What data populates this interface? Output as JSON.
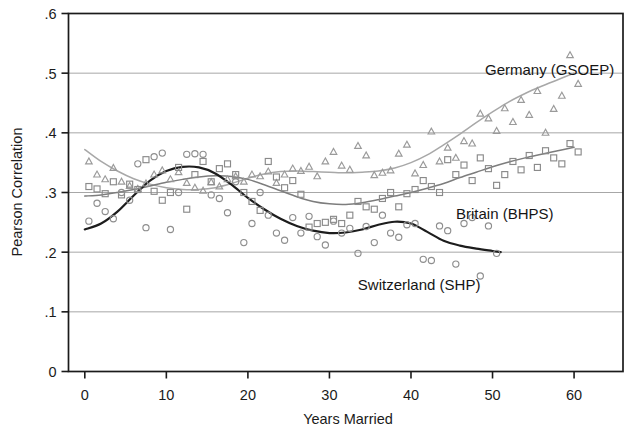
{
  "chart_data": {
    "type": "scatter",
    "title": "",
    "xlabel": "Years Married",
    "ylabel": "Pearson Correlation",
    "xlim": [
      -2,
      66
    ],
    "ylim": [
      0,
      0.6
    ],
    "xticks": [
      0,
      10,
      20,
      30,
      40,
      50,
      60
    ],
    "xticklabels": [
      "0",
      "10",
      "20",
      "30",
      "40",
      "50",
      "60"
    ],
    "yticks": [
      0,
      0.1,
      0.2,
      0.3,
      0.4,
      0.5,
      0.6
    ],
    "yticklabels": [
      "0",
      ".1",
      ".2",
      ".3",
      ".4",
      ".5",
      ".6"
    ],
    "grid": "horizontal",
    "legend_position": "inline-annotations",
    "series": [
      {
        "name": "Germany (GSOEP)",
        "marker": "triangle",
        "color": "#9a9a9a",
        "line_color": "#a8a8a8",
        "label_x": 57,
        "label_y": 0.497,
        "points": [
          {
            "x": 0.5,
            "y": 0.352
          },
          {
            "x": 1.5,
            "y": 0.33
          },
          {
            "x": 2.5,
            "y": 0.322
          },
          {
            "x": 3.5,
            "y": 0.341
          },
          {
            "x": 4.5,
            "y": 0.318
          },
          {
            "x": 5.5,
            "y": 0.311
          },
          {
            "x": 6.5,
            "y": 0.306
          },
          {
            "x": 7.5,
            "y": 0.315
          },
          {
            "x": 8.5,
            "y": 0.33
          },
          {
            "x": 9.5,
            "y": 0.337
          },
          {
            "x": 10.5,
            "y": 0.322
          },
          {
            "x": 11.5,
            "y": 0.334
          },
          {
            "x": 12.5,
            "y": 0.316
          },
          {
            "x": 13.5,
            "y": 0.308
          },
          {
            "x": 14.5,
            "y": 0.303
          },
          {
            "x": 15.5,
            "y": 0.317
          },
          {
            "x": 16.5,
            "y": 0.31
          },
          {
            "x": 17.5,
            "y": 0.322
          },
          {
            "x": 18.5,
            "y": 0.327
          },
          {
            "x": 19.5,
            "y": 0.318
          },
          {
            "x": 20.5,
            "y": 0.33
          },
          {
            "x": 21.5,
            "y": 0.327
          },
          {
            "x": 22.5,
            "y": 0.335
          },
          {
            "x": 23.5,
            "y": 0.316
          },
          {
            "x": 24.5,
            "y": 0.33
          },
          {
            "x": 25.5,
            "y": 0.34
          },
          {
            "x": 26.5,
            "y": 0.336
          },
          {
            "x": 27.5,
            "y": 0.343
          },
          {
            "x": 28.5,
            "y": 0.327
          },
          {
            "x": 29.5,
            "y": 0.352
          },
          {
            "x": 30.5,
            "y": 0.368
          },
          {
            "x": 31.5,
            "y": 0.345
          },
          {
            "x": 32.5,
            "y": 0.338
          },
          {
            "x": 33.5,
            "y": 0.378
          },
          {
            "x": 34.5,
            "y": 0.362
          },
          {
            "x": 35.5,
            "y": 0.329
          },
          {
            "x": 36.5,
            "y": 0.333
          },
          {
            "x": 37.5,
            "y": 0.337
          },
          {
            "x": 38.5,
            "y": 0.365
          },
          {
            "x": 39.5,
            "y": 0.38
          },
          {
            "x": 40.5,
            "y": 0.332
          },
          {
            "x": 41.5,
            "y": 0.346
          },
          {
            "x": 42.5,
            "y": 0.402
          },
          {
            "x": 43.5,
            "y": 0.352
          },
          {
            "x": 44.5,
            "y": 0.375
          },
          {
            "x": 45.5,
            "y": 0.358
          },
          {
            "x": 46.5,
            "y": 0.386
          },
          {
            "x": 47.5,
            "y": 0.382
          },
          {
            "x": 48.5,
            "y": 0.432
          },
          {
            "x": 49.5,
            "y": 0.424
          },
          {
            "x": 50.5,
            "y": 0.403
          },
          {
            "x": 51.5,
            "y": 0.441
          },
          {
            "x": 52.5,
            "y": 0.418
          },
          {
            "x": 53.5,
            "y": 0.455
          },
          {
            "x": 54.5,
            "y": 0.43
          },
          {
            "x": 55.5,
            "y": 0.47
          },
          {
            "x": 56.5,
            "y": 0.4
          },
          {
            "x": 57.5,
            "y": 0.44
          },
          {
            "x": 58.5,
            "y": 0.462
          },
          {
            "x": 59.5,
            "y": 0.53
          },
          {
            "x": 60.5,
            "y": 0.482
          }
        ],
        "fit": [
          {
            "x": 0,
            "y": 0.372
          },
          {
            "x": 2,
            "y": 0.352
          },
          {
            "x": 4,
            "y": 0.336
          },
          {
            "x": 6,
            "y": 0.323
          },
          {
            "x": 8,
            "y": 0.314
          },
          {
            "x": 10,
            "y": 0.308
          },
          {
            "x": 12,
            "y": 0.305
          },
          {
            "x": 14,
            "y": 0.305
          },
          {
            "x": 16,
            "y": 0.308
          },
          {
            "x": 18,
            "y": 0.315
          },
          {
            "x": 20,
            "y": 0.324
          },
          {
            "x": 22,
            "y": 0.331
          },
          {
            "x": 24,
            "y": 0.335
          },
          {
            "x": 26,
            "y": 0.336
          },
          {
            "x": 28,
            "y": 0.335
          },
          {
            "x": 30,
            "y": 0.334
          },
          {
            "x": 32,
            "y": 0.333
          },
          {
            "x": 34,
            "y": 0.334
          },
          {
            "x": 36,
            "y": 0.336
          },
          {
            "x": 38,
            "y": 0.341
          },
          {
            "x": 40,
            "y": 0.35
          },
          {
            "x": 42,
            "y": 0.363
          },
          {
            "x": 44,
            "y": 0.38
          },
          {
            "x": 46,
            "y": 0.398
          },
          {
            "x": 48,
            "y": 0.417
          },
          {
            "x": 50,
            "y": 0.435
          },
          {
            "x": 52,
            "y": 0.452
          },
          {
            "x": 54,
            "y": 0.466
          },
          {
            "x": 56,
            "y": 0.478
          },
          {
            "x": 58,
            "y": 0.489
          },
          {
            "x": 60,
            "y": 0.5
          }
        ]
      },
      {
        "name": "Britain (BHPS)",
        "marker": "square",
        "color": "#8a8a8a",
        "line_color": "#7d7d7d",
        "label_x": 51.5,
        "label_y": 0.256,
        "points": [
          {
            "x": 0.5,
            "y": 0.31
          },
          {
            "x": 1.5,
            "y": 0.306
          },
          {
            "x": 2.5,
            "y": 0.298
          },
          {
            "x": 3.5,
            "y": 0.318
          },
          {
            "x": 4.5,
            "y": 0.296
          },
          {
            "x": 5.5,
            "y": 0.314
          },
          {
            "x": 6.5,
            "y": 0.305
          },
          {
            "x": 7.5,
            "y": 0.355
          },
          {
            "x": 8.5,
            "y": 0.302
          },
          {
            "x": 9.5,
            "y": 0.287
          },
          {
            "x": 10.5,
            "y": 0.3
          },
          {
            "x": 11.5,
            "y": 0.342
          },
          {
            "x": 12.5,
            "y": 0.272
          },
          {
            "x": 13.5,
            "y": 0.33
          },
          {
            "x": 14.5,
            "y": 0.352
          },
          {
            "x": 15.5,
            "y": 0.318
          },
          {
            "x": 16.5,
            "y": 0.34
          },
          {
            "x": 17.5,
            "y": 0.348
          },
          {
            "x": 18.5,
            "y": 0.33
          },
          {
            "x": 19.5,
            "y": 0.3
          },
          {
            "x": 20.5,
            "y": 0.285
          },
          {
            "x": 21.5,
            "y": 0.27
          },
          {
            "x": 22.5,
            "y": 0.352
          },
          {
            "x": 23.5,
            "y": 0.326
          },
          {
            "x": 24.5,
            "y": 0.308
          },
          {
            "x": 25.5,
            "y": 0.32
          },
          {
            "x": 26.5,
            "y": 0.297
          },
          {
            "x": 27.5,
            "y": 0.242
          },
          {
            "x": 28.5,
            "y": 0.248
          },
          {
            "x": 29.5,
            "y": 0.25
          },
          {
            "x": 30.5,
            "y": 0.255
          },
          {
            "x": 31.5,
            "y": 0.248
          },
          {
            "x": 32.5,
            "y": 0.262
          },
          {
            "x": 33.5,
            "y": 0.285
          },
          {
            "x": 34.5,
            "y": 0.276
          },
          {
            "x": 35.5,
            "y": 0.272
          },
          {
            "x": 36.5,
            "y": 0.29
          },
          {
            "x": 37.5,
            "y": 0.3
          },
          {
            "x": 38.5,
            "y": 0.276
          },
          {
            "x": 39.5,
            "y": 0.298
          },
          {
            "x": 40.5,
            "y": 0.305
          },
          {
            "x": 41.5,
            "y": 0.32
          },
          {
            "x": 42.5,
            "y": 0.31
          },
          {
            "x": 43.5,
            "y": 0.3
          },
          {
            "x": 44.5,
            "y": 0.355
          },
          {
            "x": 45.5,
            "y": 0.33
          },
          {
            "x": 46.5,
            "y": 0.346
          },
          {
            "x": 47.5,
            "y": 0.32
          },
          {
            "x": 48.5,
            "y": 0.358
          },
          {
            "x": 49.5,
            "y": 0.34
          },
          {
            "x": 50.5,
            "y": 0.312
          },
          {
            "x": 51.5,
            "y": 0.33
          },
          {
            "x": 52.5,
            "y": 0.352
          },
          {
            "x": 53.5,
            "y": 0.338
          },
          {
            "x": 54.5,
            "y": 0.362
          },
          {
            "x": 55.5,
            "y": 0.342
          },
          {
            "x": 56.5,
            "y": 0.37
          },
          {
            "x": 57.5,
            "y": 0.358
          },
          {
            "x": 58.5,
            "y": 0.348
          },
          {
            "x": 59.5,
            "y": 0.382
          },
          {
            "x": 60.5,
            "y": 0.368
          }
        ],
        "fit": [
          {
            "x": 0,
            "y": 0.294
          },
          {
            "x": 2,
            "y": 0.296
          },
          {
            "x": 4,
            "y": 0.3
          },
          {
            "x": 6,
            "y": 0.305
          },
          {
            "x": 8,
            "y": 0.311
          },
          {
            "x": 10,
            "y": 0.317
          },
          {
            "x": 12,
            "y": 0.322
          },
          {
            "x": 14,
            "y": 0.326
          },
          {
            "x": 16,
            "y": 0.328
          },
          {
            "x": 18,
            "y": 0.327
          },
          {
            "x": 20,
            "y": 0.322
          },
          {
            "x": 22,
            "y": 0.313
          },
          {
            "x": 24,
            "y": 0.303
          },
          {
            "x": 26,
            "y": 0.293
          },
          {
            "x": 28,
            "y": 0.285
          },
          {
            "x": 30,
            "y": 0.281
          },
          {
            "x": 32,
            "y": 0.28
          },
          {
            "x": 34,
            "y": 0.283
          },
          {
            "x": 36,
            "y": 0.288
          },
          {
            "x": 38,
            "y": 0.294
          },
          {
            "x": 40,
            "y": 0.3
          },
          {
            "x": 42,
            "y": 0.307
          },
          {
            "x": 44,
            "y": 0.315
          },
          {
            "x": 46,
            "y": 0.325
          },
          {
            "x": 48,
            "y": 0.334
          },
          {
            "x": 50,
            "y": 0.343
          },
          {
            "x": 52,
            "y": 0.351
          },
          {
            "x": 54,
            "y": 0.358
          },
          {
            "x": 56,
            "y": 0.364
          },
          {
            "x": 58,
            "y": 0.37
          },
          {
            "x": 60,
            "y": 0.376
          }
        ]
      },
      {
        "name": "Switzerland (SHP)",
        "marker": "circle",
        "color": "#8e8e8e",
        "line_color": "#1d1d1d",
        "label_x": 41,
        "label_y": 0.137,
        "points": [
          {
            "x": 0.5,
            "y": 0.252
          },
          {
            "x": 1.5,
            "y": 0.282
          },
          {
            "x": 2.5,
            "y": 0.268
          },
          {
            "x": 3.5,
            "y": 0.256
          },
          {
            "x": 4.5,
            "y": 0.3
          },
          {
            "x": 5.5,
            "y": 0.287
          },
          {
            "x": 6.5,
            "y": 0.348
          },
          {
            "x": 7.5,
            "y": 0.241
          },
          {
            "x": 8.5,
            "y": 0.36
          },
          {
            "x": 9.5,
            "y": 0.366
          },
          {
            "x": 10.5,
            "y": 0.238
          },
          {
            "x": 11.5,
            "y": 0.3
          },
          {
            "x": 12.5,
            "y": 0.364
          },
          {
            "x": 13.5,
            "y": 0.365
          },
          {
            "x": 14.5,
            "y": 0.364
          },
          {
            "x": 15.5,
            "y": 0.296
          },
          {
            "x": 16.5,
            "y": 0.29
          },
          {
            "x": 17.5,
            "y": 0.266
          },
          {
            "x": 18.5,
            "y": 0.318
          },
          {
            "x": 19.5,
            "y": 0.216
          },
          {
            "x": 20.5,
            "y": 0.248
          },
          {
            "x": 21.5,
            "y": 0.3
          },
          {
            "x": 22.5,
            "y": 0.262
          },
          {
            "x": 23.5,
            "y": 0.232
          },
          {
            "x": 24.5,
            "y": 0.22
          },
          {
            "x": 25.5,
            "y": 0.258
          },
          {
            "x": 26.5,
            "y": 0.232
          },
          {
            "x": 27.5,
            "y": 0.26
          },
          {
            "x": 28.5,
            "y": 0.226
          },
          {
            "x": 29.5,
            "y": 0.212
          },
          {
            "x": 30.5,
            "y": 0.252
          },
          {
            "x": 31.5,
            "y": 0.232
          },
          {
            "x": 32.5,
            "y": 0.24
          },
          {
            "x": 33.5,
            "y": 0.198
          },
          {
            "x": 34.5,
            "y": 0.243
          },
          {
            "x": 35.5,
            "y": 0.216
          },
          {
            "x": 36.5,
            "y": 0.262
          },
          {
            "x": 37.5,
            "y": 0.232
          },
          {
            "x": 38.5,
            "y": 0.225
          },
          {
            "x": 39.5,
            "y": 0.246
          },
          {
            "x": 40.5,
            "y": 0.248
          },
          {
            "x": 41.5,
            "y": 0.188
          },
          {
            "x": 42.5,
            "y": 0.186
          },
          {
            "x": 43.5,
            "y": 0.244
          },
          {
            "x": 44.5,
            "y": 0.236
          },
          {
            "x": 45.5,
            "y": 0.18
          },
          {
            "x": 46.5,
            "y": 0.248
          },
          {
            "x": 47.5,
            "y": 0.258
          },
          {
            "x": 48.5,
            "y": 0.16
          },
          {
            "x": 49.5,
            "y": 0.244
          },
          {
            "x": 50.5,
            "y": 0.198
          }
        ],
        "fit": [
          {
            "x": 0,
            "y": 0.238
          },
          {
            "x": 2,
            "y": 0.248
          },
          {
            "x": 4,
            "y": 0.268
          },
          {
            "x": 6,
            "y": 0.295
          },
          {
            "x": 8,
            "y": 0.32
          },
          {
            "x": 10,
            "y": 0.336
          },
          {
            "x": 12,
            "y": 0.343
          },
          {
            "x": 14,
            "y": 0.342
          },
          {
            "x": 16,
            "y": 0.332
          },
          {
            "x": 18,
            "y": 0.313
          },
          {
            "x": 20,
            "y": 0.291
          },
          {
            "x": 22,
            "y": 0.272
          },
          {
            "x": 24,
            "y": 0.256
          },
          {
            "x": 26,
            "y": 0.244
          },
          {
            "x": 28,
            "y": 0.236
          },
          {
            "x": 30,
            "y": 0.232
          },
          {
            "x": 32,
            "y": 0.233
          },
          {
            "x": 34,
            "y": 0.238
          },
          {
            "x": 36,
            "y": 0.246
          },
          {
            "x": 38,
            "y": 0.251
          },
          {
            "x": 40,
            "y": 0.248
          },
          {
            "x": 42,
            "y": 0.234
          },
          {
            "x": 44,
            "y": 0.219
          },
          {
            "x": 46,
            "y": 0.211
          },
          {
            "x": 48,
            "y": 0.206
          },
          {
            "x": 50,
            "y": 0.202
          },
          {
            "x": 51,
            "y": 0.2
          }
        ]
      }
    ]
  },
  "colors": {
    "axis": "#1a1a1a",
    "grid": "#9d9d9d",
    "background": "#ffffff"
  }
}
